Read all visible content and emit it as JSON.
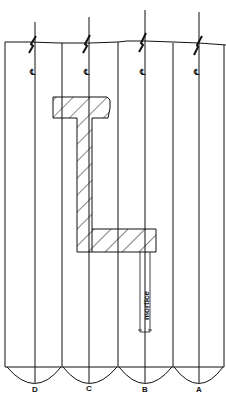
{
  "diagram": {
    "type": "technical-drawing",
    "planks": [
      {
        "label": "D",
        "left": 5,
        "right": 62,
        "center": 35
      },
      {
        "label": "C",
        "left": 62,
        "right": 118,
        "center": 89
      },
      {
        "label": "B",
        "left": 118,
        "right": 173,
        "center": 145
      },
      {
        "label": "A",
        "left": 173,
        "right": 224,
        "center": 199
      }
    ],
    "centerline_symbol": "℄",
    "mortice_label": "mortice",
    "colors": {
      "line": "#111111",
      "background": "#ffffff"
    }
  }
}
